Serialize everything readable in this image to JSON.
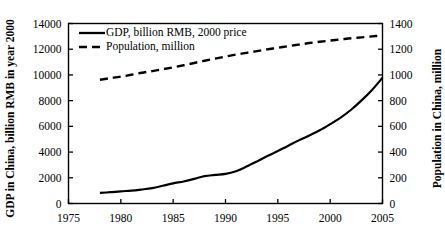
{
  "chart_data": {
    "type": "line",
    "title": "",
    "xlabel": "",
    "ylabel": "GDP in China, billion RMB in year 2000",
    "y2label": "Population in China, million",
    "xlim": [
      1975,
      2005
    ],
    "ylim": [
      0,
      14000
    ],
    "y2lim": [
      0,
      1400
    ],
    "xticks": [
      "1975",
      "1980",
      "1985",
      "1990",
      "1995",
      "2000",
      "2005"
    ],
    "yticks": [
      "0",
      "2000",
      "4000",
      "6000",
      "8000",
      "10000",
      "12000",
      "14000"
    ],
    "y2ticks": [
      "0",
      "200",
      "400",
      "600",
      "800",
      "1000",
      "1200",
      "1400"
    ],
    "grid": false,
    "legend_position": "top-left",
    "legend": [
      {
        "label": "GDP, billion RMB, 2000 price",
        "style": "solid",
        "color": "#000000",
        "axis": "left"
      },
      {
        "label": "Population, million",
        "style": "dashed",
        "color": "#000000",
        "axis": "right"
      }
    ],
    "x": [
      1978,
      1979,
      1980,
      1981,
      1982,
      1983,
      1984,
      1985,
      1986,
      1987,
      1988,
      1989,
      1990,
      1991,
      1992,
      1993,
      1994,
      1995,
      1996,
      1997,
      1998,
      1999,
      2000,
      2001,
      2002,
      2003,
      2004,
      2005
    ],
    "series": [
      {
        "name": "GDP, billion RMB, 2000 price",
        "axis": "left",
        "unit": "billion RMB (2000 price)",
        "values": [
          820,
          880,
          950,
          1000,
          1090,
          1200,
          1380,
          1570,
          1710,
          1910,
          2130,
          2220,
          2300,
          2510,
          2870,
          3270,
          3690,
          4080,
          4490,
          4910,
          5290,
          5690,
          6170,
          6680,
          7290,
          8020,
          8830,
          9780
        ]
      },
      {
        "name": "Population, million",
        "axis": "right",
        "unit": "million people",
        "values": [
          963,
          975,
          987,
          1001,
          1017,
          1030,
          1044,
          1059,
          1075,
          1093,
          1110,
          1127,
          1143,
          1158,
          1172,
          1185,
          1199,
          1211,
          1224,
          1236,
          1248,
          1258,
          1267,
          1276,
          1285,
          1292,
          1300,
          1308
        ]
      }
    ]
  },
  "axes": {
    "left_title": "GDP in China, billion RMB in year 2000",
    "right_title": "Population in China, million"
  }
}
